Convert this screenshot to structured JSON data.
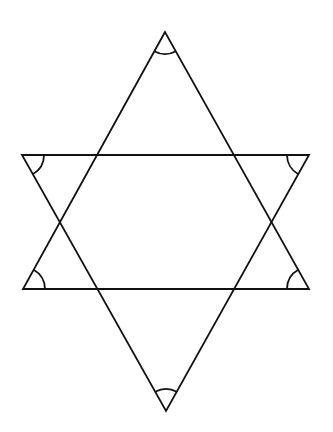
{
  "diagram": {
    "stroke_color": "#111111",
    "background": "#ffffff",
    "triangles": [
      {
        "name": "upward-triangle",
        "points": [
          [
            165,
            32
          ],
          [
            23,
            289
          ],
          [
            309,
            289
          ]
        ]
      },
      {
        "name": "downward-triangle",
        "points": [
          [
            22,
            155
          ],
          [
            309,
            155
          ],
          [
            166,
            411
          ]
        ]
      }
    ],
    "angle_arcs": [
      {
        "vertex": "top",
        "at": [
          165,
          32
        ],
        "radius": 22
      },
      {
        "vertex": "upper-left",
        "at": [
          22,
          155
        ],
        "radius": 22
      },
      {
        "vertex": "upper-right",
        "at": [
          309,
          155
        ],
        "radius": 22
      },
      {
        "vertex": "lower-left",
        "at": [
          23,
          289
        ],
        "radius": 22
      },
      {
        "vertex": "lower-right",
        "at": [
          309,
          289
        ],
        "radius": 22
      },
      {
        "vertex": "bottom",
        "at": [
          166,
          411
        ],
        "radius": 22
      }
    ]
  }
}
